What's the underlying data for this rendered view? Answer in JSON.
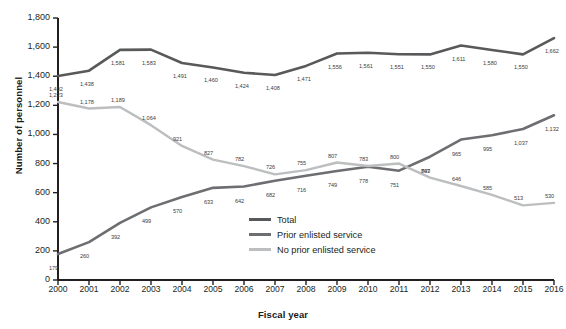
{
  "chart_data": {
    "type": "line",
    "title": "",
    "xlabel": "Fiscal year",
    "ylabel": "Number of personnel",
    "categories": [
      "2000",
      "2001",
      "2002",
      "2003",
      "2004",
      "2005",
      "2006",
      "2007",
      "2008",
      "2009",
      "2010",
      "2011",
      "2012",
      "2013",
      "2014",
      "2015",
      "2016"
    ],
    "ylim": [
      0,
      1800
    ],
    "yticks": [
      "0",
      "200",
      "400",
      "600",
      "800",
      "1,000",
      "1,200",
      "1,400",
      "1,600",
      "1,800"
    ],
    "ytick_values": [
      0,
      200,
      400,
      600,
      800,
      1000,
      1200,
      1400,
      1600,
      1800
    ],
    "grid": false,
    "legend_position": "inside-center-bottom",
    "series": [
      {
        "name": "Total",
        "color": "#58595b",
        "values": [
          1402,
          1438,
          1581,
          1583,
          1491,
          1460,
          1424,
          1408,
          1471,
          1556,
          1561,
          1551,
          1550,
          1611,
          1580,
          1550,
          1662
        ],
        "labels": [
          "1,402",
          "1,438",
          "1,581",
          "1,583",
          "1,491",
          "1,460",
          "1,424",
          "1,408",
          "1,471",
          "1,556",
          "1,561",
          "1,551",
          "1,550",
          "1,611",
          "1,580",
          "1,550",
          "1,662"
        ]
      },
      {
        "name": "Prior enlisted service",
        "color": "#6d6e71",
        "values": [
          179,
          260,
          392,
          499,
          570,
          633,
          642,
          682,
          716,
          749,
          778,
          751,
          847,
          965,
          995,
          1037,
          1132
        ],
        "labels": [
          "179",
          "260",
          "392",
          "499",
          "570",
          "633",
          "642",
          "682",
          "716",
          "749",
          "778",
          "751",
          "847",
          "965",
          "995",
          "1,037",
          "1,132"
        ]
      },
      {
        "name": "No prior enlisted service",
        "color": "#bcbec0",
        "values": [
          1223,
          1178,
          1189,
          1064,
          921,
          827,
          782,
          726,
          755,
          807,
          783,
          800,
          703,
          646,
          585,
          513,
          530
        ],
        "labels": [
          "1,223",
          "1,178",
          "1,189",
          "1,064",
          "921",
          "827",
          "782",
          "726",
          "755",
          "807",
          "783",
          "800",
          "703",
          "646",
          "585",
          "513",
          "530"
        ]
      }
    ]
  }
}
